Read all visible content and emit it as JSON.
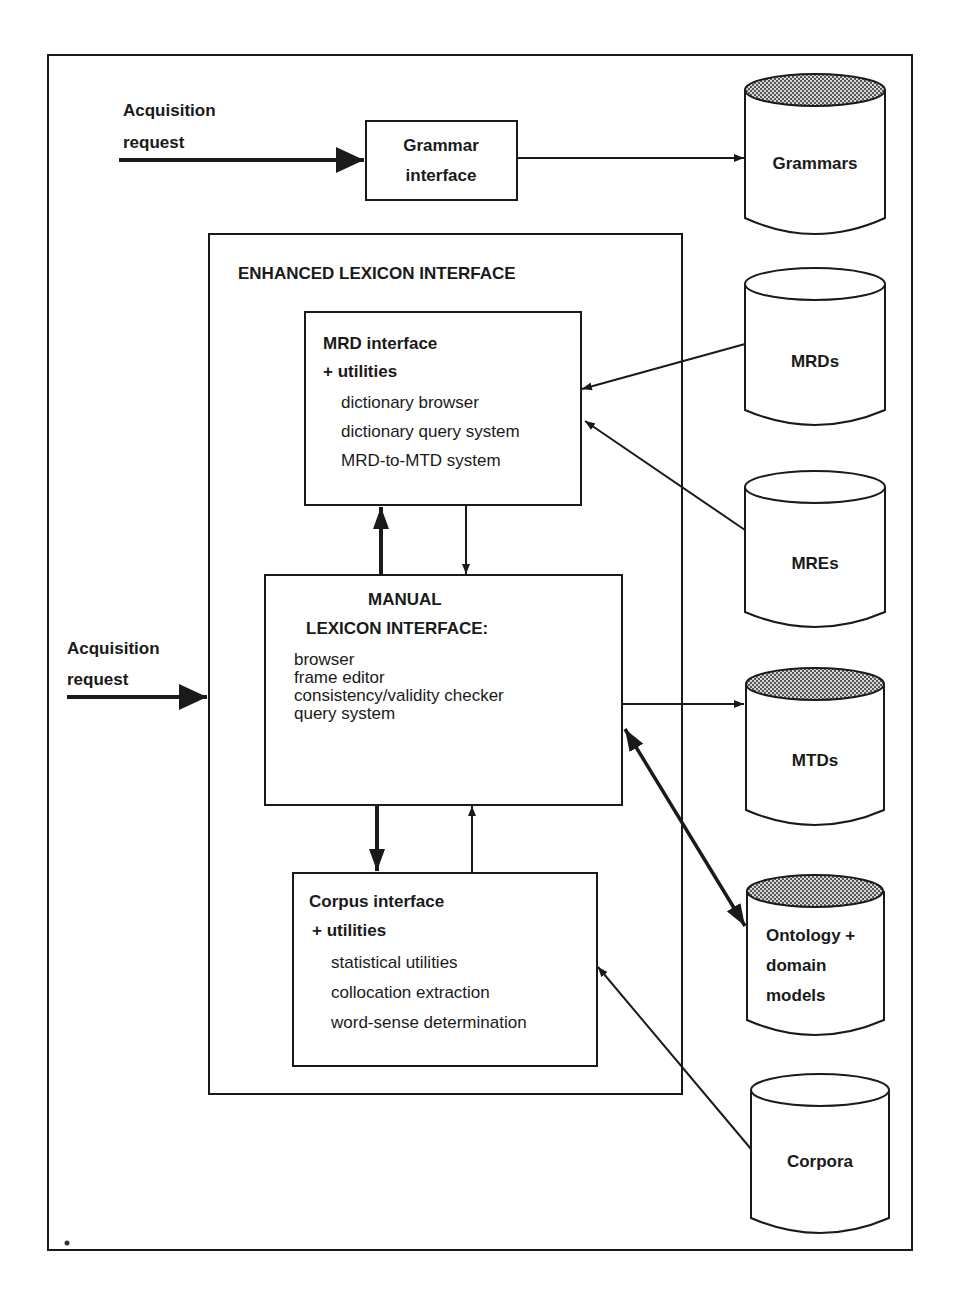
{
  "acquisition_top": {
    "line1": "Acquisition",
    "line2": "request"
  },
  "acquisition_left": {
    "line1": "Acquisition",
    "line2": "request"
  },
  "grammar_interface": {
    "line1": "Grammar",
    "line2": "interface"
  },
  "enhanced_lexicon": {
    "title": "ENHANCED LEXICON INTERFACE"
  },
  "mrd_interface": {
    "title1": "MRD interface",
    "title2": "+ utilities",
    "items": [
      "dictionary browser",
      "dictionary query system",
      "MRD-to-MTD system"
    ]
  },
  "manual_lexicon": {
    "title1": "MANUAL",
    "title2": "LEXICON INTERFACE:",
    "items": [
      "browser",
      "frame editor",
      "consistency/validity checker",
      "query system"
    ]
  },
  "corpus_interface": {
    "title1": "Corpus interface",
    "title2": "+ utilities",
    "items": [
      "statistical utilities",
      "collocation extraction",
      "word-sense determination"
    ]
  },
  "databases": {
    "grammars": {
      "label": "Grammars",
      "shaded": true
    },
    "mrds": {
      "label": "MRDs",
      "shaded": false
    },
    "mres": {
      "label": "MREs",
      "shaded": false
    },
    "mtds": {
      "label": "MTDs",
      "shaded": true
    },
    "ontology": {
      "line1": "Ontology +",
      "line2": "domain",
      "line3": "models",
      "shaded": true
    },
    "corpora": {
      "label": "Corpora",
      "shaded": false
    }
  },
  "colors": {
    "ink": "#1a1a1a",
    "background": "#ffffff",
    "shade": "#9a9a9a"
  }
}
